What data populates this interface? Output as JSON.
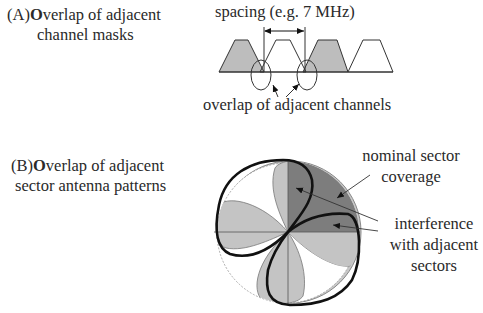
{
  "section_a": {
    "title_prefix": "(A)",
    "title_bold_letter": "O",
    "title_rest_line1": "verlap of adjacent",
    "title_line2": "channel masks",
    "spacing_label": "spacing (e.g. 7 MHz)",
    "overlap_label": "overlap of adjacent channels"
  },
  "section_b": {
    "title_prefix": "(B)",
    "title_bold_letter": "O",
    "title_rest_line1": "verlap of adjacent",
    "title_line2": "sector antenna patterns",
    "nominal_label_line1": "nominal sector",
    "nominal_label_line2": "coverage",
    "interference_label_line1": "interference",
    "interference_label_line2": "with adjacent",
    "interference_label_line3": "sectors"
  },
  "colors": {
    "light_gray": "#c4c4c4",
    "mid_gray": "#bdbdbd",
    "dark_gray": "#7a7a7a",
    "outline": "#111111",
    "text": "#2a2a2a"
  }
}
